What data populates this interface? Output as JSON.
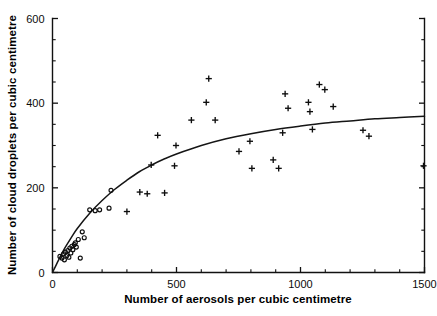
{
  "chart_data": {
    "type": "scatter",
    "title": "",
    "xlabel": "Number of aerosols per cubic centimetre",
    "ylabel": "Number of cloud droplets per cubic centimetre",
    "xlim": [
      0,
      1500
    ],
    "ylim": [
      0,
      600
    ],
    "xticks": [
      0,
      500,
      1000,
      1500
    ],
    "yticks": [
      0,
      200,
      400,
      600
    ],
    "xtick_labels": [
      "0",
      "500",
      "1000",
      "1500"
    ],
    "ytick_labels": [
      "0",
      "200",
      "400",
      "600"
    ],
    "x_minor_step": 100,
    "y_minor_step": 50,
    "grid": false,
    "legend": null,
    "series": [
      {
        "name": "low-aerosol observations",
        "marker": "open-circle",
        "points": [
          [
            30,
            38
          ],
          [
            38,
            34
          ],
          [
            45,
            44
          ],
          [
            48,
            30
          ],
          [
            52,
            48
          ],
          [
            58,
            40
          ],
          [
            62,
            52
          ],
          [
            66,
            36
          ],
          [
            70,
            58
          ],
          [
            74,
            46
          ],
          [
            78,
            62
          ],
          [
            82,
            54
          ],
          [
            88,
            66
          ],
          [
            92,
            70
          ],
          [
            96,
            60
          ],
          [
            104,
            78
          ],
          [
            112,
            34
          ],
          [
            120,
            96
          ],
          [
            128,
            82
          ],
          [
            150,
            148
          ],
          [
            172,
            146
          ],
          [
            190,
            148
          ],
          [
            228,
            152
          ],
          [
            236,
            194
          ]
        ]
      },
      {
        "name": "high-aerosol observations",
        "marker": "plus",
        "points": [
          [
            300,
            144
          ],
          [
            352,
            190
          ],
          [
            382,
            186
          ],
          [
            398,
            254
          ],
          [
            424,
            324
          ],
          [
            452,
            188
          ],
          [
            492,
            252
          ],
          [
            498,
            300
          ],
          [
            560,
            360
          ],
          [
            620,
            402
          ],
          [
            630,
            458
          ],
          [
            656,
            360
          ],
          [
            752,
            286
          ],
          [
            796,
            310
          ],
          [
            804,
            246
          ],
          [
            890,
            266
          ],
          [
            912,
            246
          ],
          [
            928,
            330
          ],
          [
            938,
            422
          ],
          [
            950,
            388
          ],
          [
            1032,
            402
          ],
          [
            1038,
            380
          ],
          [
            1048,
            338
          ],
          [
            1076,
            444
          ],
          [
            1098,
            432
          ],
          [
            1132,
            392
          ],
          [
            1252,
            336
          ],
          [
            1276,
            322
          ],
          [
            1496,
            252
          ]
        ]
      }
    ],
    "fit_curve": {
      "description": "saturating logarithmic fit of droplet count versus aerosol count",
      "points": [
        [
          0,
          0
        ],
        [
          25,
          30
        ],
        [
          50,
          58
        ],
        [
          75,
          82
        ],
        [
          100,
          104
        ],
        [
          150,
          140
        ],
        [
          200,
          170
        ],
        [
          250,
          196
        ],
        [
          300,
          218
        ],
        [
          350,
          238
        ],
        [
          400,
          254
        ],
        [
          450,
          268
        ],
        [
          500,
          280
        ],
        [
          600,
          300
        ],
        [
          700,
          316
        ],
        [
          800,
          328
        ],
        [
          900,
          338
        ],
        [
          1000,
          346
        ],
        [
          1100,
          353
        ],
        [
          1200,
          358
        ],
        [
          1300,
          363
        ],
        [
          1400,
          366
        ],
        [
          1500,
          369
        ]
      ]
    }
  }
}
